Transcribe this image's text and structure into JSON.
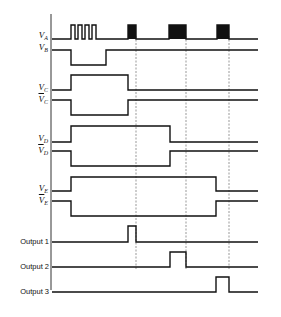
{
  "diagram": {
    "type": "timing-diagram",
    "signals": [
      {
        "id": "VA",
        "label": "V",
        "sub": "A",
        "inverted": false
      },
      {
        "id": "VB",
        "label": "V",
        "sub": "B",
        "inverted": false
      },
      {
        "id": "VC",
        "label": "V",
        "sub": "C",
        "inverted": false
      },
      {
        "id": "VCbar",
        "label": "V",
        "sub": "C",
        "inverted": true
      },
      {
        "id": "VD",
        "label": "V",
        "sub": "D",
        "inverted": false
      },
      {
        "id": "VDbar",
        "label": "V",
        "sub": "D",
        "inverted": true
      },
      {
        "id": "VE",
        "label": "V",
        "sub": "E",
        "inverted": false
      },
      {
        "id": "VEbar",
        "label": "V",
        "sub": "E",
        "inverted": true
      }
    ],
    "outputs": [
      {
        "label": "Output 1"
      },
      {
        "label": "Output 2"
      },
      {
        "label": "Output 3"
      }
    ]
  }
}
